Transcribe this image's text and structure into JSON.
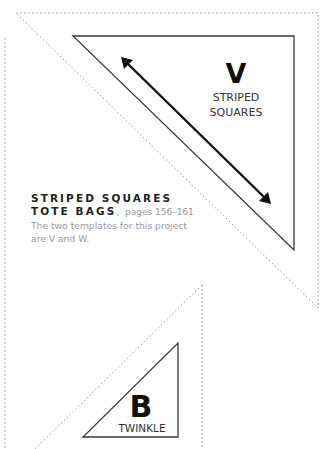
{
  "templates": [
    {
      "letter": "V",
      "name_line1": "STRIPED",
      "name_line2": "SQUARES"
    },
    {
      "letter": "B",
      "name_line1": "TWINKLE"
    }
  ],
  "caption": {
    "title_line1": "STRIPED SQUARES",
    "title_line2": "TOTE BAGS",
    "separator": ",",
    "pages": "pages 156–161",
    "body_line1": "The two templates for this project",
    "body_line2": "are V and W."
  },
  "colors": {
    "cut_line": "#9a9a9a",
    "outline": "#3a3a3a",
    "text_dark": "#222222",
    "text_light": "#9a9a9a"
  }
}
